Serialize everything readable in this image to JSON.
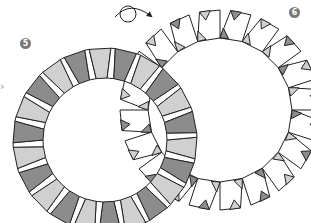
{
  "diagram": {
    "steps": [
      {
        "number": "5",
        "description": "Ring made of trapezoid units (gray and light-gray alternating)"
      },
      {
        "number": "6",
        "description": "Ring after flipping, showing white square units with gray triangle corners"
      }
    ],
    "flip_arrow": "turn-over-arrow",
    "side_marker": "›",
    "colors": {
      "dark_unit": "#8c8c8c",
      "light_unit": "#d0d0d0",
      "white_unit": "#ffffff",
      "outline": "#222222",
      "badge": "#777777"
    }
  }
}
